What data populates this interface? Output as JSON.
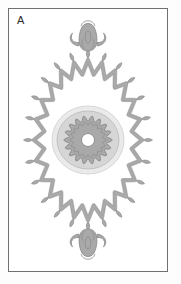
{
  "plate": {
    "label": "A",
    "width": 181,
    "height": 284,
    "background_color": "#fdfdfd",
    "frame": {
      "border_color": "#6f6f6f",
      "fill_color": "#ffffff",
      "inset_px": 8,
      "border_width_px": 1
    }
  },
  "palette": {
    "outline": "#8d8d8d",
    "outline_soft": "#9a9a9a",
    "mid_gray": "#a9a9a9",
    "pale_gray": "#d6d6d6",
    "very_pale_gray": "#eaeaea",
    "white": "#ffffff",
    "label_text": "#2b2b2b"
  },
  "ornament": {
    "name": "radial-rosette-medallion",
    "description": "Symmetric vertical-axis medallion: central scalloped rosette within concentric halos, enclosed by a zigzag star band tipped with leaf finials, capped by bud finials above and below.",
    "center": {
      "x": 80,
      "y": 132
    },
    "symmetry_axis": "vertical",
    "components": [
      {
        "id": "outer-halo",
        "type": "ellipse",
        "label": "outer pale halo",
        "cx": 80,
        "cy": 132,
        "rx": 36,
        "ry": 34,
        "fill": "#eaeaea",
        "stroke": "#d2d2d2"
      },
      {
        "id": "pale-ring",
        "type": "ellipse",
        "label": "pale gray ring",
        "cx": 80,
        "cy": 132,
        "rx": 31,
        "ry": 29,
        "fill": "#d6d6d6",
        "stroke": "#bdbdbd"
      },
      {
        "id": "scalloped-rosette",
        "type": "scalloped-disc",
        "label": "scalloped rosette",
        "cx": 80,
        "cy": 132,
        "base_radius": 21.5,
        "lobe_amplitude": 2.6,
        "lobes": 18,
        "fill": "#a9a9a9",
        "stroke": "#8d8d8d"
      },
      {
        "id": "inner-rosette-line",
        "type": "scalloped-disc",
        "label": "inner scallop outline",
        "cx": 80,
        "cy": 132,
        "base_radius": 16.5,
        "lobe_amplitude": 1.6,
        "lobes": 18,
        "fill": "none",
        "stroke": "#8d8d8d"
      },
      {
        "id": "center-hole",
        "type": "circle",
        "label": "white center hole",
        "cx": 80,
        "cy": 132,
        "r": 6.5,
        "fill": "#ffffff",
        "stroke": "#8d8d8d"
      },
      {
        "id": "zigzag-star-band",
        "type": "zigzag-ring",
        "label": "zigzag chevron star band",
        "cx": 80,
        "cy": 132,
        "points": 24,
        "outer_rx": 54,
        "outer_ry": 80,
        "inner_rx": 44,
        "inner_ry": 66,
        "band_thickness": 3.2,
        "fill": "#a9a9a9",
        "stroke": "#8d8d8d"
      },
      {
        "id": "leaf-tips",
        "type": "radial-leaves",
        "label": "leaf tips on star vertices",
        "count": 24,
        "leaf_length": 9,
        "leaf_width": 3.4,
        "gap_from_vertex": 1.5,
        "fill": "#a9a9a9",
        "stroke": "#8d8d8d"
      },
      {
        "id": "top-finial",
        "type": "bud-finial",
        "label": "top bud finial",
        "anchor_x": 80,
        "anchor_y": 44,
        "orientation": "up",
        "fill": "#a9a9a9",
        "stroke": "#8d8d8d"
      },
      {
        "id": "top-droplet",
        "type": "teardrop",
        "label": "top teardrop",
        "cx": 80,
        "cy": 29,
        "rx": 2.8,
        "ry": 6,
        "fill": "#a9a9a9",
        "stroke": "#8d8d8d"
      },
      {
        "id": "bottom-finial",
        "type": "bud-finial",
        "label": "bottom bud finial",
        "anchor_x": 80,
        "anchor_y": 220,
        "orientation": "down",
        "fill": "#a9a9a9",
        "stroke": "#8d8d8d"
      },
      {
        "id": "bottom-droplet",
        "type": "teardrop",
        "label": "bottom teardrop",
        "cx": 80,
        "cy": 235,
        "rx": 2.8,
        "ry": 6,
        "fill": "#a9a9a9",
        "stroke": "#8d8d8d"
      }
    ]
  }
}
